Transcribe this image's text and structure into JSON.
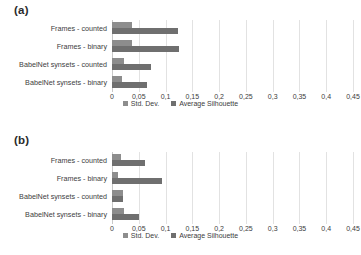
{
  "figure": {
    "panels": [
      {
        "label": "(a)"
      },
      {
        "label": "(b)"
      }
    ],
    "legend": [
      {
        "label": "Std. Dev.",
        "color": "#8d8d8d"
      },
      {
        "label": "Average Silhouette",
        "color": "#6f6f6f"
      }
    ],
    "tick_labels": [
      "0",
      "0,05",
      "0,1",
      "0,15",
      "0,2",
      "0,25",
      "0,3",
      "0,35",
      "0,4",
      "0,45"
    ]
  },
  "chart_data": [
    {
      "type": "bar",
      "title": "(a)",
      "orientation": "horizontal",
      "categories": [
        "Frames - counted",
        "Frames - binary",
        "BabelNet synsets - counted",
        "BabelNet synsets - binary"
      ],
      "series": [
        {
          "name": "Std. Dev.",
          "color": "#8d8d8d",
          "values": [
            0.037,
            0.037,
            0.022,
            0.018
          ]
        },
        {
          "name": "Average Silhouette",
          "color": "#6f6f6f",
          "values": [
            0.123,
            0.125,
            0.072,
            0.065
          ]
        }
      ],
      "xlabel": "",
      "ylabel": "",
      "xlim": [
        0,
        0.45
      ],
      "xticks": [
        0,
        0.05,
        0.1,
        0.15,
        0.2,
        0.25,
        0.3,
        0.35,
        0.4,
        0.45
      ],
      "xtick_labels": [
        "0",
        "0,05",
        "0,1",
        "0,15",
        "0,2",
        "0,25",
        "0,3",
        "0,35",
        "0,4",
        "0,45"
      ],
      "grid": true,
      "legend_position": "bottom"
    },
    {
      "type": "bar",
      "title": "(b)",
      "orientation": "horizontal",
      "categories": [
        "Frames - counted",
        "Frames - binary",
        "BabelNet synsets - counted",
        "BabelNet synsets - binary"
      ],
      "series": [
        {
          "name": "Std. Dev.",
          "color": "#8d8d8d",
          "values": [
            0.017,
            0.012,
            0.02,
            0.022
          ]
        },
        {
          "name": "Average Silhouette",
          "color": "#6f6f6f",
          "values": [
            0.061,
            0.093,
            0.02,
            0.05
          ]
        }
      ],
      "xlabel": "",
      "ylabel": "",
      "xlim": [
        0,
        0.45
      ],
      "xticks": [
        0,
        0.05,
        0.1,
        0.15,
        0.2,
        0.25,
        0.3,
        0.35,
        0.4,
        0.45
      ],
      "xtick_labels": [
        "0",
        "0,05",
        "0,1",
        "0,15",
        "0,2",
        "0,25",
        "0,3",
        "0,35",
        "0,4",
        "0,45"
      ],
      "grid": true,
      "legend_position": "bottom"
    }
  ]
}
